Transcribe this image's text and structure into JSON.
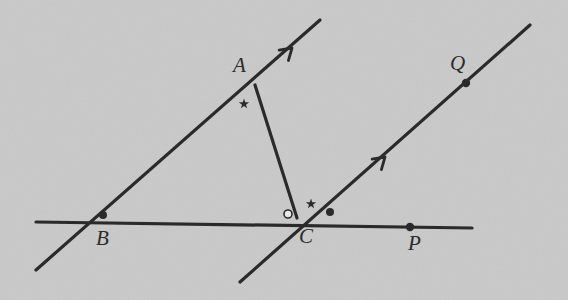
{
  "figure": {
    "type": "geometry-diagram",
    "width": 568,
    "height": 300,
    "background_color": "#c9c9c9",
    "ink_color": "#2b2b2b"
  },
  "labels": {
    "a": "A",
    "b": "B",
    "c": "C",
    "p": "P",
    "q": "Q"
  },
  "points": [
    {
      "name": "A",
      "label": "A",
      "x": 255,
      "y": 85,
      "dot": false,
      "label_dx": -22,
      "label_dy": -30
    },
    {
      "name": "B",
      "label": "B",
      "x": 108,
      "y": 222,
      "dot": true,
      "label_dx": -12,
      "label_dy": 6
    },
    {
      "name": "C",
      "label": "C",
      "x": 297,
      "y": 218,
      "dot": false,
      "label_dx": 2,
      "label_dy": 8
    },
    {
      "name": "P",
      "label": "P",
      "x": 410,
      "y": 227,
      "dot": true,
      "label_dx": -2,
      "label_dy": 6
    },
    {
      "name": "Q",
      "label": "Q",
      "x": 466,
      "y": 83,
      "dot": true,
      "label_dx": -16,
      "label_dy": -30
    }
  ],
  "lines": [
    {
      "name": "line-BA-extended",
      "x1": 36,
      "y1": 270,
      "x2": 320,
      "y2": 20,
      "width": 3.2
    },
    {
      "name": "line-CQ-extended",
      "x1": 240,
      "y1": 282,
      "x2": 530,
      "y2": 25,
      "width": 3.2
    },
    {
      "name": "line-horizontal-BCP",
      "x1": 36,
      "y1": 222,
      "x2": 472,
      "y2": 228,
      "width": 3.2
    },
    {
      "name": "segment-AC",
      "x1": 255,
      "y1": 85,
      "x2": 297,
      "y2": 218,
      "width": 3.2
    }
  ],
  "arrow_marks": [
    {
      "name": "arrow-on-BA",
      "x": 292,
      "y": 48,
      "angle": -41.4
    },
    {
      "name": "arrow-on-CQ",
      "x": 385,
      "y": 157,
      "angle": -41.5
    }
  ],
  "angle_marks": [
    {
      "name": "star-angle-at-A",
      "kind": "star",
      "x": 244,
      "y": 104
    },
    {
      "name": "star-angle-at-C",
      "kind": "star",
      "x": 311,
      "y": 204
    },
    {
      "name": "open-circle-angle-at-C",
      "kind": "open-circle",
      "x": 288,
      "y": 214,
      "r": 4
    },
    {
      "name": "dot-angle-at-C",
      "kind": "filled-dot",
      "x": 330,
      "y": 212,
      "r": 4
    },
    {
      "name": "dot-angle-at-B",
      "kind": "filled-dot",
      "x": 103,
      "y": 215,
      "r": 4
    }
  ],
  "point_dots": [
    {
      "name": "dot-at-B",
      "x": 108,
      "y": 222,
      "r": 0
    },
    {
      "name": "dot-at-P",
      "x": 410,
      "y": 227,
      "r": 4.2
    },
    {
      "name": "dot-at-Q",
      "x": 466,
      "y": 83,
      "r": 4.2
    }
  ]
}
